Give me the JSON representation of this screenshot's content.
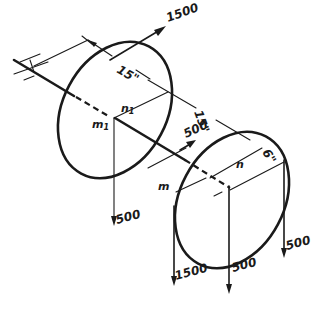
{
  "diagram": {
    "ink_color": "#1a1a1a",
    "background": "#ffffff",
    "forces": {
      "top_left_pulley_diagonal": "1500",
      "left_pulley_vertical": "500",
      "middle_diagonal": "500",
      "right_pulley_left_vertical": "1500",
      "right_pulley_center_vertical": "500",
      "right_pulley_right_vertical": "500"
    },
    "dimensions": {
      "bearing_to_left_pulley": "15\"",
      "left_to_right_pulley": "15\"",
      "right_pulley_radius": "6\""
    },
    "point_labels": {
      "left_m": "m",
      "left_m_sub": "1",
      "left_n": "n",
      "left_n_sub": "1",
      "right_m": "m",
      "right_n": "n"
    }
  }
}
